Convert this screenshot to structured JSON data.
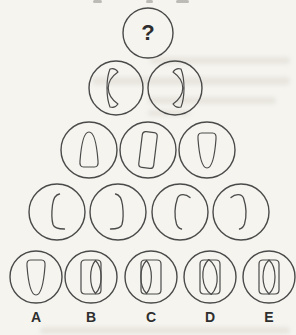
{
  "puzzle": {
    "question_mark": "?",
    "option_labels": [
      "A",
      "B",
      "C",
      "D",
      "E"
    ],
    "stroke_color": "#4a4a4a",
    "paper_color": "#f5f4ef",
    "rows": [
      {
        "circles": [
          {
            "shapes": [],
            "content": "question-mark"
          }
        ]
      },
      {
        "circles": [
          {
            "shapes": [
              "crescent-left"
            ]
          },
          {
            "shapes": [
              "crescent-right"
            ]
          }
        ]
      },
      {
        "circles": [
          {
            "shapes": [
              "bullet-up"
            ]
          },
          {
            "shapes": [
              "rounded-rect-tilted"
            ]
          },
          {
            "shapes": [
              "bullet-down"
            ]
          }
        ]
      },
      {
        "circles": [
          {
            "shapes": [
              "open-hook-bottom-right"
            ]
          },
          {
            "shapes": [
              "open-hook-bottom-left"
            ]
          },
          {
            "shapes": [
              "open-hook-top-right"
            ]
          },
          {
            "shapes": [
              "open-hook-top-left"
            ]
          }
        ]
      },
      {
        "circles": [
          {
            "shapes": [
              "bullet-down"
            ],
            "option": "A"
          },
          {
            "shapes": [
              "rounded-rect",
              "lens-right"
            ],
            "option": "B"
          },
          {
            "shapes": [
              "rounded-rect",
              "lens-left"
            ],
            "option": "C"
          },
          {
            "shapes": [
              "rounded-rect",
              "lens-wide"
            ],
            "option": "D"
          },
          {
            "shapes": [
              "rounded-rect",
              "lens-center"
            ],
            "option": "E"
          }
        ]
      }
    ]
  }
}
